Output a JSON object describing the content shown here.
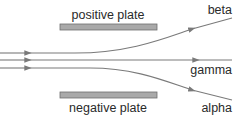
{
  "diagram": {
    "labels": {
      "positive_plate": "positive plate",
      "negative_plate": "negative plate",
      "beta": "beta",
      "gamma": "gamma",
      "alpha": "alpha"
    },
    "colors": {
      "line": "#7a7a7a",
      "plate_fill": "#a9a9a9",
      "plate_stroke": "#6e6e6e",
      "text": "#2a2a2a"
    }
  }
}
